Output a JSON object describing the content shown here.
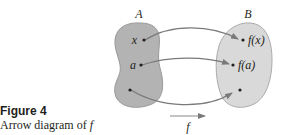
{
  "figure": {
    "title": "Figure 4",
    "caption_prefix": "Arrow diagram of ",
    "caption_function": "f"
  },
  "diagram": {
    "set_a": {
      "label": "A",
      "fill": "#b3b3b3",
      "points": [
        {
          "label": "x"
        },
        {
          "label": "a"
        },
        {
          "label": ""
        }
      ]
    },
    "set_b": {
      "label": "B",
      "fill": "#d9d9d9",
      "points": [
        {
          "label": "f(x)"
        },
        {
          "label": "f(a)"
        },
        {
          "label": ""
        }
      ]
    },
    "mapping_label": "f",
    "arrow_color": "#7a7a7a",
    "mappings": [
      {
        "from": "x",
        "to": "f(x)"
      },
      {
        "from": "a",
        "to": "f(a)"
      },
      {
        "from": "",
        "to": ""
      }
    ]
  }
}
